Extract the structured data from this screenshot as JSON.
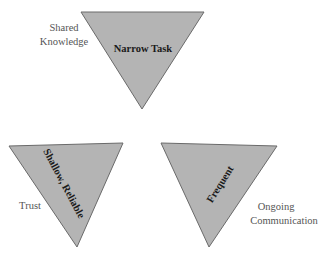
{
  "diagram": {
    "triangles": [
      {
        "id": "top",
        "inner_label": "Narrow Task",
        "outer_label_lines": [
          "Shared",
          "Knowledge"
        ]
      },
      {
        "id": "bottom-left",
        "inner_label": "Shallow, Reliable",
        "outer_label_lines": [
          "Trust"
        ]
      },
      {
        "id": "bottom-right",
        "inner_label": "Frequent",
        "outer_label_lines": [
          "Ongoing",
          "Communication"
        ]
      }
    ],
    "colors": {
      "fill": "#b4b4b4",
      "stroke": "#5a5a5a",
      "outer_text": "#555555",
      "inner_text": "#1a1a1a"
    }
  }
}
